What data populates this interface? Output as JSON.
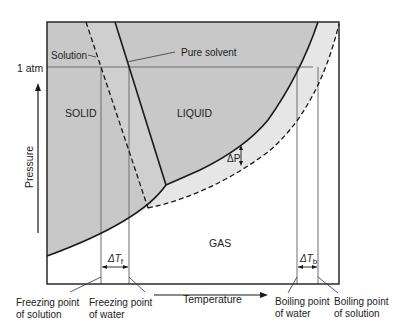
{
  "diagram": {
    "axes": {
      "x_label": "Temperature",
      "y_label": "Pressure",
      "y_tick": "1 atm"
    },
    "regions": {
      "solid": "SOLID",
      "liquid": "LIQUID",
      "gas": "GAS"
    },
    "curve_labels": {
      "solution": "Solution",
      "pure_solvent": "Pure solvent"
    },
    "annotations": {
      "delta_p": "ΔP",
      "delta_tf_prefix": "ΔT",
      "delta_tf_sub": "f",
      "delta_tb_prefix": "ΔT",
      "delta_tb_sub": "b"
    },
    "bottom_labels": {
      "fp_solution_1": "Freezing point",
      "fp_solution_2": "of solution",
      "fp_water_1": "Freezing point",
      "fp_water_2": "of water",
      "bp_water_1": "Boiling point",
      "bp_water_2": "of water",
      "bp_solution_1": "Boiling point",
      "bp_solution_2": "of solution"
    },
    "colors": {
      "solid_liquid_fill": "#c8c8c8",
      "solution_band_fill": "#e6e6e6",
      "gas_fill": "#ffffff",
      "line": "#1a1a1a",
      "guide_line": "#6e6e6e"
    }
  }
}
